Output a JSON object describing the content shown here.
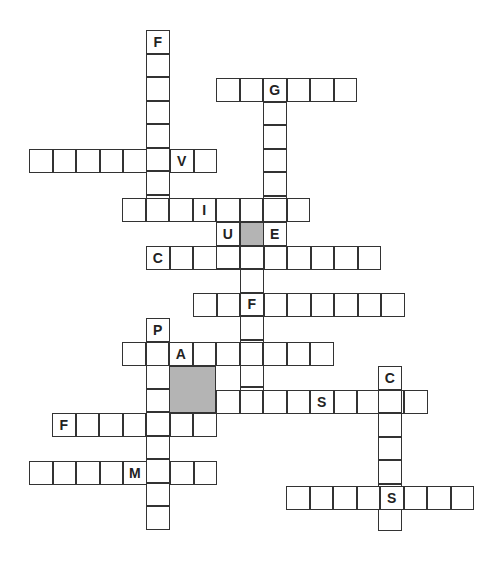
{
  "puzzle": {
    "cell_size": 23.5,
    "shade_color": "#b4b4b4",
    "words": [
      {
        "id": "d1",
        "dir": "down",
        "x": 146,
        "y": 30,
        "len": 8,
        "letters": {
          "0": "F"
        }
      },
      {
        "id": "a1",
        "dir": "across",
        "x": 216,
        "y": 78,
        "len": 6,
        "letters": {
          "2": "G"
        }
      },
      {
        "id": "d2",
        "dir": "down",
        "x": 263,
        "y": 78,
        "len": 6,
        "letters": {}
      },
      {
        "id": "a2",
        "dir": "across",
        "x": 29,
        "y": 149,
        "len": 8,
        "letters": {
          "6": "V"
        }
      },
      {
        "id": "a3",
        "dir": "across",
        "x": 122,
        "y": 198,
        "len": 8,
        "letters": {
          "3": "I"
        }
      },
      {
        "id": "a4",
        "dir": "across",
        "x": 216,
        "y": 222,
        "len": 3,
        "letters": {
          "0": "U",
          "2": "E"
        }
      },
      {
        "id": "a5",
        "dir": "across",
        "x": 146,
        "y": 246,
        "len": 10,
        "letters": {
          "0": "C"
        }
      },
      {
        "id": "d3",
        "dir": "down",
        "x": 216,
        "y": 222,
        "len": 2,
        "letters": {}
      },
      {
        "id": "d4",
        "dir": "down",
        "x": 240,
        "y": 222,
        "len": 8,
        "letters": {}
      },
      {
        "id": "a6",
        "dir": "across",
        "x": 193,
        "y": 293,
        "len": 9,
        "letters": {
          "2": "F"
        }
      },
      {
        "id": "d5",
        "dir": "down",
        "x": 146,
        "y": 318,
        "len": 9,
        "letters": {
          "0": "P"
        }
      },
      {
        "id": "a7",
        "dir": "across",
        "x": 122,
        "y": 342,
        "len": 9,
        "letters": {
          "2": "A"
        }
      },
      {
        "id": "a8",
        "dir": "across",
        "x": 216,
        "y": 390,
        "len": 9,
        "letters": {
          "4": "S"
        }
      },
      {
        "id": "d6",
        "dir": "down",
        "x": 378,
        "y": 366,
        "len": 7,
        "letters": {
          "0": "C",
          "5": "S"
        }
      },
      {
        "id": "a9",
        "dir": "across",
        "x": 52,
        "y": 413,
        "len": 7,
        "letters": {
          "0": "F"
        }
      },
      {
        "id": "a10",
        "dir": "across",
        "x": 29,
        "y": 461,
        "len": 8,
        "letters": {
          "4": "M"
        }
      },
      {
        "id": "a11",
        "dir": "across",
        "x": 286,
        "y": 486,
        "len": 8,
        "letters": {
          "4": "S"
        }
      }
    ],
    "shaded": [
      {
        "x": 240,
        "y": 222,
        "w": 1,
        "h": 1
      },
      {
        "x": 169,
        "y": 366,
        "w": 2,
        "h": 2
      }
    ]
  }
}
